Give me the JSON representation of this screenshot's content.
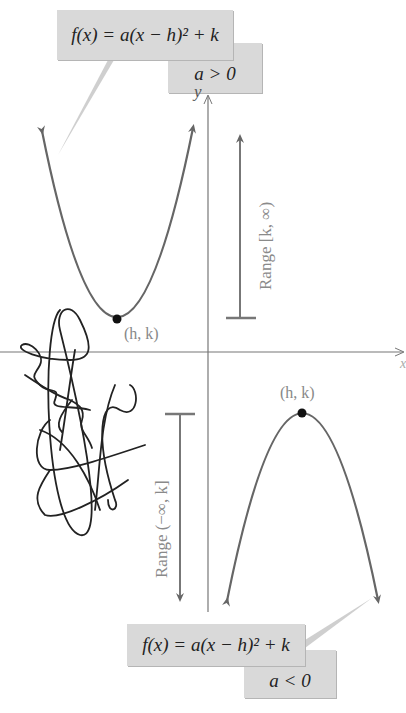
{
  "top": {
    "formula": "f(x) = a(x − h)² + k",
    "condition": "a > 0",
    "vertex_label": "(h, k)",
    "range_label": "Range [k, ∞)"
  },
  "bottom": {
    "formula": "f(x) = a(x − h)² + k",
    "condition": "a < 0",
    "vertex_label": "(h, k)",
    "range_label": "Range (−∞, k]"
  },
  "axes": {
    "y_label": "y",
    "x_label": "x"
  },
  "colors": {
    "curve": "#666666",
    "axis": "#777777",
    "box": "#d9d9d9",
    "text": "#222222",
    "label": "#888888",
    "scribble": "#222222"
  }
}
